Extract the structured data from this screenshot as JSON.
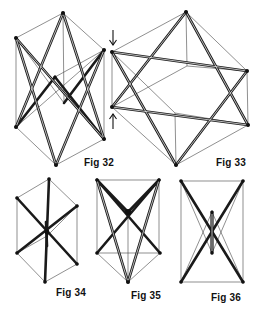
{
  "figures": [
    {
      "id": "fig32",
      "label": "Fig 32"
    },
    {
      "id": "fig33",
      "label": "Fig 33"
    },
    {
      "id": "fig34",
      "label": "Fig 34"
    },
    {
      "id": "fig35",
      "label": "Fig 35"
    },
    {
      "id": "fig36",
      "label": "Fig 36"
    }
  ],
  "annotations": {
    "arrow_down": "↓",
    "arrow_up": "↑"
  },
  "colors": {
    "ink": "#111111",
    "background": "#ffffff"
  }
}
